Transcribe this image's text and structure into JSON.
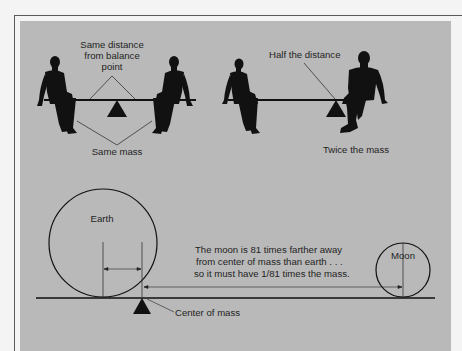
{
  "figure": {
    "colors": {
      "page_background": "#f4f4f4",
      "frame_line": "#5a5a5a",
      "panel_background": "#b9b9b9",
      "ink": "#111111",
      "text": "#1f1f1f"
    },
    "top_left_seesaw": {
      "label_distance_line1": "Same distance",
      "label_distance_line2": "from balance",
      "label_distance_line3": "point",
      "label_mass": "Same mass"
    },
    "top_right_seesaw": {
      "label_distance": "Half the distance",
      "label_mass": "Twice the mass"
    },
    "earth_moon": {
      "earth_label": "Earth",
      "moon_label": "Moon",
      "explanation_line1": "The moon is 81 times farther away",
      "explanation_line2": "from center of mass than earth . . .",
      "explanation_line3": "so it must have 1/81 times the mass.",
      "fulcrum_label": "Center of mass",
      "distance_ratio": 81,
      "mass_ratio": "1/81"
    }
  }
}
